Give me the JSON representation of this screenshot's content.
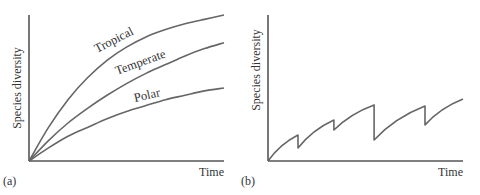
{
  "chart_data": [
    {
      "type": "line",
      "panel_label": "(a)",
      "title": "",
      "xlabel": "Time",
      "ylabel": "Species diversity",
      "xlim": [
        0,
        1
      ],
      "ylim": [
        0,
        1
      ],
      "grid": false,
      "legend": "inline-curve-labels",
      "series": [
        {
          "name": "Tropical",
          "x": [
            0,
            0.1,
            0.2,
            0.3,
            0.4,
            0.5,
            0.6,
            0.7,
            0.8,
            0.9,
            1.0
          ],
          "values": [
            0,
            0.23,
            0.42,
            0.57,
            0.69,
            0.78,
            0.85,
            0.9,
            0.94,
            0.97,
            1.0
          ]
        },
        {
          "name": "Temperate",
          "x": [
            0,
            0.1,
            0.2,
            0.3,
            0.4,
            0.5,
            0.6,
            0.7,
            0.8,
            0.9,
            1.0
          ],
          "values": [
            0,
            0.14,
            0.26,
            0.36,
            0.45,
            0.53,
            0.6,
            0.66,
            0.72,
            0.77,
            0.81
          ]
        },
        {
          "name": "Polar",
          "x": [
            0,
            0.1,
            0.2,
            0.3,
            0.4,
            0.5,
            0.6,
            0.7,
            0.8,
            0.9,
            1.0
          ],
          "values": [
            0,
            0.09,
            0.17,
            0.23,
            0.29,
            0.34,
            0.38,
            0.42,
            0.45,
            0.48,
            0.5
          ]
        }
      ]
    },
    {
      "type": "line",
      "panel_label": "(b)",
      "title": "",
      "xlabel": "Time",
      "ylabel": "Species diversity",
      "xlim": [
        0,
        1
      ],
      "ylim": [
        0,
        1
      ],
      "grid": false,
      "legend": "none",
      "series": [
        {
          "name": "Diversity (sawtooth)",
          "x": [
            0,
            0.154,
            0.154,
            0.338,
            0.338,
            0.544,
            0.544,
            0.805,
            0.805,
            1.0
          ],
          "values": [
            0,
            0.178,
            0.089,
            0.281,
            0.212,
            0.384,
            0.144,
            0.377,
            0.247,
            0.425
          ]
        }
      ]
    }
  ]
}
